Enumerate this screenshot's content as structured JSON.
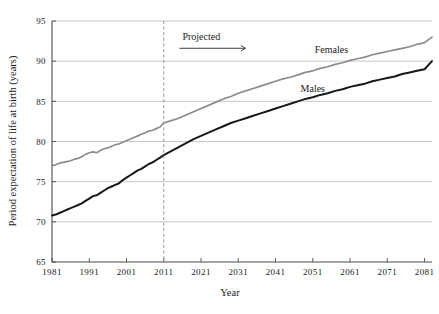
{
  "chart_data": {
    "type": "line",
    "title": "",
    "xlabel": "Year",
    "ylabel": "Period expectation of life at birth (years)",
    "xlim": [
      1981,
      2083
    ],
    "ylim": [
      65,
      95
    ],
    "grid": true,
    "legend_position": "inline-right",
    "x_ticks": [
      "1981",
      "1991",
      "2001",
      "2011",
      "2021",
      "2031",
      "2041",
      "2051",
      "2061",
      "2071",
      "2081"
    ],
    "x_tick_values": [
      1981,
      1991,
      2001,
      2011,
      2021,
      2031,
      2041,
      2051,
      2061,
      2071,
      2081
    ],
    "y_ticks": [
      "65",
      "70",
      "75",
      "80",
      "85",
      "90",
      "95"
    ],
    "y_tick_values": [
      65,
      70,
      75,
      80,
      85,
      90,
      95
    ],
    "annotations": [
      {
        "name": "projection-divider",
        "text": "",
        "x_value": 2011,
        "style": "dashed-vertical"
      },
      {
        "name": "projected-label",
        "text": "Projected",
        "x_value": 2016,
        "y_value": 92.6,
        "arrow": "right"
      }
    ],
    "series": [
      {
        "name": "Females",
        "color": "#8c8c8c",
        "label_x": 2056,
        "label_y": 91.0,
        "x": [
          1981,
          1982,
          1983,
          1984,
          1985,
          1986,
          1987,
          1988,
          1989,
          1990,
          1991,
          1992,
          1993,
          1994,
          1995,
          1996,
          1997,
          1998,
          1999,
          2000,
          2001,
          2002,
          2003,
          2004,
          2005,
          2006,
          2007,
          2008,
          2009,
          2010,
          2011,
          2013,
          2015,
          2017,
          2019,
          2021,
          2023,
          2025,
          2027,
          2029,
          2031,
          2033,
          2035,
          2037,
          2039,
          2041,
          2043,
          2045,
          2047,
          2049,
          2051,
          2053,
          2055,
          2057,
          2059,
          2061,
          2063,
          2065,
          2067,
          2069,
          2071,
          2073,
          2075,
          2077,
          2079,
          2081,
          2083
        ],
        "values": [
          77.0,
          77.1,
          77.3,
          77.4,
          77.5,
          77.6,
          77.8,
          77.9,
          78.1,
          78.4,
          78.6,
          78.7,
          78.6,
          78.9,
          79.1,
          79.2,
          79.4,
          79.6,
          79.7,
          79.9,
          80.1,
          80.3,
          80.5,
          80.7,
          80.9,
          81.1,
          81.3,
          81.4,
          81.6,
          81.8,
          82.3,
          82.6,
          82.9,
          83.3,
          83.7,
          84.1,
          84.5,
          84.9,
          85.3,
          85.6,
          86.0,
          86.3,
          86.6,
          86.9,
          87.2,
          87.5,
          87.8,
          88.0,
          88.3,
          88.6,
          88.8,
          89.1,
          89.3,
          89.6,
          89.8,
          90.1,
          90.3,
          90.5,
          90.8,
          91.0,
          91.2,
          91.4,
          91.6,
          91.8,
          92.1,
          92.3,
          93.0
        ]
      },
      {
        "name": "Males",
        "color": "#171717",
        "label_x": 2051,
        "label_y": 86.2,
        "x": [
          1981,
          1982,
          1983,
          1984,
          1985,
          1986,
          1987,
          1988,
          1989,
          1990,
          1991,
          1992,
          1993,
          1994,
          1995,
          1996,
          1997,
          1998,
          1999,
          2000,
          2001,
          2002,
          2003,
          2004,
          2005,
          2006,
          2007,
          2008,
          2009,
          2010,
          2011,
          2013,
          2015,
          2017,
          2019,
          2021,
          2023,
          2025,
          2027,
          2029,
          2031,
          2033,
          2035,
          2037,
          2039,
          2041,
          2043,
          2045,
          2047,
          2049,
          2051,
          2053,
          2055,
          2057,
          2059,
          2061,
          2063,
          2065,
          2067,
          2069,
          2071,
          2073,
          2075,
          2077,
          2079,
          2081,
          2083
        ],
        "values": [
          70.8,
          70.9,
          71.1,
          71.3,
          71.5,
          71.7,
          71.9,
          72.1,
          72.3,
          72.6,
          72.9,
          73.2,
          73.3,
          73.6,
          73.9,
          74.2,
          74.4,
          74.6,
          74.8,
          75.2,
          75.5,
          75.8,
          76.1,
          76.4,
          76.6,
          76.9,
          77.2,
          77.4,
          77.7,
          78.0,
          78.3,
          78.8,
          79.3,
          79.8,
          80.3,
          80.7,
          81.1,
          81.5,
          81.9,
          82.3,
          82.6,
          82.9,
          83.2,
          83.5,
          83.8,
          84.1,
          84.4,
          84.7,
          85.0,
          85.3,
          85.5,
          85.8,
          86.0,
          86.3,
          86.5,
          86.8,
          87.0,
          87.2,
          87.5,
          87.7,
          87.9,
          88.1,
          88.4,
          88.6,
          88.8,
          89.0,
          90.0
        ]
      }
    ]
  }
}
